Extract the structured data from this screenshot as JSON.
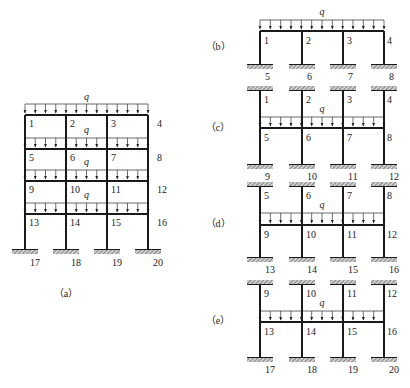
{
  "colors": {
    "ink": "#1a1a1a",
    "hatch": "#888888",
    "load": "#333333"
  },
  "load_label": "q",
  "figure_a": {
    "caption": "（a）",
    "columns_x": [
      25,
      66,
      107,
      148
    ],
    "floors": [
      {
        "load_y": 104,
        "beam_y": 115,
        "q_y": 100,
        "nodes": [
          "1",
          "2",
          "3",
          "4"
        ]
      },
      {
        "load_y": 138,
        "beam_y": 149,
        "q_y": 133,
        "nodes": [
          "5",
          "6",
          "7",
          "8"
        ]
      },
      {
        "load_y": 170,
        "beam_y": 181,
        "q_y": 165,
        "nodes": [
          "9",
          "10",
          "11",
          "12"
        ]
      },
      {
        "load_y": 203,
        "beam_y": 214,
        "q_y": 198,
        "nodes": [
          "13",
          "14",
          "15",
          "16"
        ]
      }
    ],
    "support_y": 250,
    "base_nodes": [
      "17",
      "18",
      "19",
      "20"
    ],
    "caption_xy": [
      66,
      297
    ]
  },
  "subframes": [
    {
      "id": "b",
      "caption": "（b）",
      "caption_y": 50,
      "top_support_y": null,
      "load_y": 20,
      "beam_y": 31,
      "q_y": 15,
      "bottom_support_y": 65,
      "top_nodes": [],
      "beam_nodes": [
        "1",
        "2",
        "3",
        "4"
      ],
      "bottom_nodes": [
        "5",
        "6",
        "7",
        "8"
      ]
    },
    {
      "id": "c",
      "caption": "（c）",
      "caption_y": 131,
      "top_support_y": 90,
      "load_y": 117,
      "beam_y": 128,
      "q_y": 112,
      "bottom_support_y": 165,
      "top_nodes": [
        "1",
        "2",
        "3",
        "4"
      ],
      "beam_nodes": [
        "5",
        "6",
        "7",
        "8"
      ],
      "bottom_nodes": [
        "9",
        "10",
        "11",
        "12"
      ]
    },
    {
      "id": "d",
      "caption": "（d）",
      "caption_y": 227,
      "top_support_y": 186,
      "load_y": 213,
      "beam_y": 225,
      "q_y": 208,
      "bottom_support_y": 258,
      "top_nodes": [
        "5",
        "6",
        "7",
        "8"
      ],
      "beam_nodes": [
        "9",
        "10",
        "11",
        "12"
      ],
      "bottom_nodes": [
        "13",
        "14",
        "15",
        "16"
      ]
    },
    {
      "id": "e",
      "caption": "（e）",
      "caption_y": 324,
      "top_support_y": 284,
      "load_y": 311,
      "beam_y": 322,
      "q_y": 306,
      "bottom_support_y": 358,
      "top_nodes": [
        "9",
        "10",
        "11",
        "12"
      ],
      "beam_nodes": [
        "13",
        "14",
        "15",
        "16"
      ],
      "bottom_nodes": [
        "17",
        "18",
        "19",
        "20"
      ]
    }
  ],
  "subframe_columns_x": [
    260,
    302,
    343,
    384
  ],
  "subframe_caption_x": 218
}
